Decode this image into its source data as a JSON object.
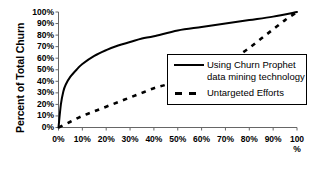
{
  "chart_data": {
    "type": "line",
    "title": "",
    "xlabel": "",
    "ylabel": "Percent of Total Churn",
    "xlim": [
      0,
      100
    ],
    "ylim": [
      0,
      100
    ],
    "grid": false,
    "legend_position": "inside-lower-right",
    "x_tick_labels": [
      "0%",
      "10%",
      "20%",
      "30%",
      "40%",
      "50%",
      "60%",
      "70%",
      "80%",
      "90%",
      "100\n%"
    ],
    "x_ticks": [
      0,
      10,
      20,
      30,
      40,
      50,
      60,
      70,
      80,
      90,
      100
    ],
    "y_tick_labels": [
      "0%",
      "10%",
      "20%",
      "30%",
      "40%",
      "50%",
      "60%",
      "70%",
      "80%",
      "90%",
      "100%"
    ],
    "y_ticks": [
      0,
      10,
      20,
      30,
      40,
      50,
      60,
      70,
      80,
      90,
      100
    ],
    "series": [
      {
        "name": "Using Churn Prophet\ndata mining technology",
        "style": "solid",
        "color": "#000000",
        "x": [
          0,
          1,
          2,
          3,
          5,
          8,
          10,
          15,
          20,
          25,
          30,
          35,
          40,
          50,
          60,
          70,
          80,
          90,
          100
        ],
        "values": [
          0,
          20,
          31,
          37,
          44,
          51,
          55,
          62,
          67,
          71,
          74,
          77,
          79,
          84,
          87,
          90,
          93,
          96,
          100
        ]
      },
      {
        "name": "Untargeted Efforts",
        "style": "dashed",
        "color": "#000000",
        "x": [
          0,
          5,
          10,
          15,
          20,
          25,
          30,
          35,
          40,
          45,
          50,
          55,
          60,
          65,
          70,
          75,
          80,
          85,
          90,
          95,
          100
        ],
        "values": [
          0,
          5,
          10,
          14,
          18,
          22,
          26,
          30,
          34,
          37,
          41,
          45,
          49,
          53,
          57,
          62,
          69,
          77,
          85,
          93,
          100
        ]
      }
    ]
  },
  "legend": {
    "entries": [
      {
        "label": "Using Churn Prophet\ndata mining technology",
        "style": "solid"
      },
      {
        "label": "Untargeted Efforts",
        "style": "dashed"
      }
    ]
  },
  "axis": {
    "y_title": "Percent of Total Churn"
  },
  "colors": {
    "line": "#000000",
    "axis": "#555555",
    "background": "#ffffff"
  }
}
